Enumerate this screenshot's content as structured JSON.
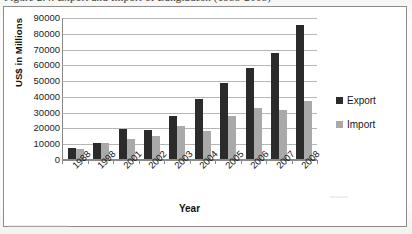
{
  "figure": {
    "caption": "Figure 2.4: Export and Import of Bangladesh (1988-2008)"
  },
  "legend": {
    "position": "right",
    "items": [
      {
        "label": "Export",
        "color": "#2b2b2b",
        "swatch": "legend-swatch-export"
      },
      {
        "label": "Import",
        "color": "#a9a9a9",
        "swatch": "legend-swatch-import"
      }
    ]
  },
  "axes": {
    "y_title": "US$ in Millions",
    "x_title": "Year"
  },
  "chart_data": {
    "type": "bar",
    "title": "",
    "xlabel": "Year",
    "ylabel": "US$ in Millions",
    "ylim": [
      0,
      90000
    ],
    "ytick_step": 10000,
    "yticks": [
      0,
      10000,
      20000,
      30000,
      40000,
      50000,
      60000,
      70000,
      80000,
      90000
    ],
    "ytick_labels": [
      "0",
      "10000",
      "20000",
      "30000",
      "40000",
      "50000",
      "60000",
      "70000",
      "80000",
      "90000"
    ],
    "grid": true,
    "grid_axis": "y",
    "legend_position": "right",
    "categories": [
      "1988",
      "1998",
      "2001",
      "2002",
      "2003",
      "2004",
      "2005",
      "2006",
      "2007",
      "2008"
    ],
    "series": [
      {
        "name": "Export",
        "color": "#2b2b2b",
        "values": [
          7000,
          10000,
          19000,
          18500,
          27000,
          38000,
          48000,
          58000,
          67000,
          85000
        ]
      },
      {
        "name": "Import",
        "color": "#a9a9a9",
        "values": [
          6500,
          10000,
          12500,
          14500,
          21000,
          18000,
          27000,
          32500,
          31000,
          37000
        ]
      }
    ]
  }
}
